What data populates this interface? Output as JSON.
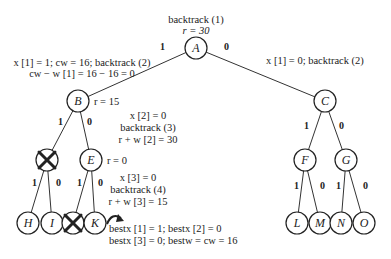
{
  "nodes": {
    "A": "A",
    "B": "B",
    "C": "C",
    "E": "E",
    "F": "F",
    "G": "G",
    "H": "H",
    "I": "I",
    "K": "K",
    "L": "L",
    "M": "M",
    "N": "N",
    "O": "O"
  },
  "edge_labels": {
    "one": "1",
    "zero": "0"
  },
  "annotations": {
    "a_top1": "backtrack (1)",
    "a_top2": "r = 30",
    "left1": "x [1] = 1; cw = 16; backtrack (2)",
    "left2": "cw − w [1] = 16 − 16 = 0",
    "right1": "x [1] = 0; backtrack (2)",
    "b_r": "r = 15",
    "mid1": "x [2] = 0",
    "mid2": "backtrack (3)",
    "mid3": "r + w [2] = 30",
    "e_r": "r = 0",
    "low1": "x [3] = 0",
    "low2": "backtrack (4)",
    "low3": "r + w [3] = 15",
    "best1": "bestx [1] = 1; bestx [2] = 0",
    "best2": "bestx [3] = 0; bestw = cw = 16"
  }
}
